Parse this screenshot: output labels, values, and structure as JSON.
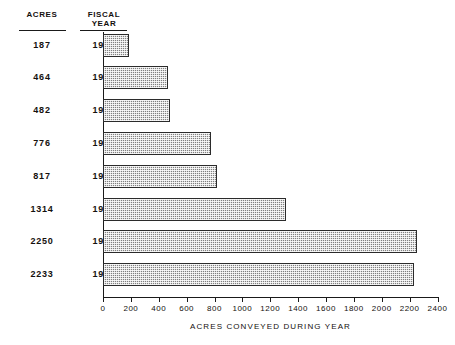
{
  "table": {
    "headers": {
      "acres": "ACRES",
      "fiscal_year_line1": "FISCAL",
      "fiscal_year_line2": "YEAR"
    }
  },
  "chart_data": {
    "type": "bar",
    "orientation": "horizontal",
    "title": "",
    "xlabel": "ACRES CONVEYED DURING YEAR",
    "ylabel": "FISCAL YEAR",
    "categories": [
      "1957",
      "1958",
      "1959",
      "1960",
      "1961",
      "1962",
      "1963",
      "1964"
    ],
    "values": [
      187,
      464,
      482,
      776,
      817,
      1314,
      2250,
      2233
    ],
    "xlim": [
      0,
      2400
    ],
    "xticks": [
      0,
      200,
      400,
      600,
      800,
      1000,
      1200,
      1400,
      1600,
      1800,
      2000,
      2200,
      2400
    ],
    "xtick_labels": [
      "0",
      "200",
      "400",
      "600",
      "800",
      "1000",
      "1200",
      "1400",
      "1600",
      "1800",
      "2000",
      "2200",
      "2400"
    ],
    "grid": false,
    "legend": null,
    "bar_fill": "#b9b9b9",
    "bar_border": "#2b2b2b",
    "background": "#ffffff"
  }
}
